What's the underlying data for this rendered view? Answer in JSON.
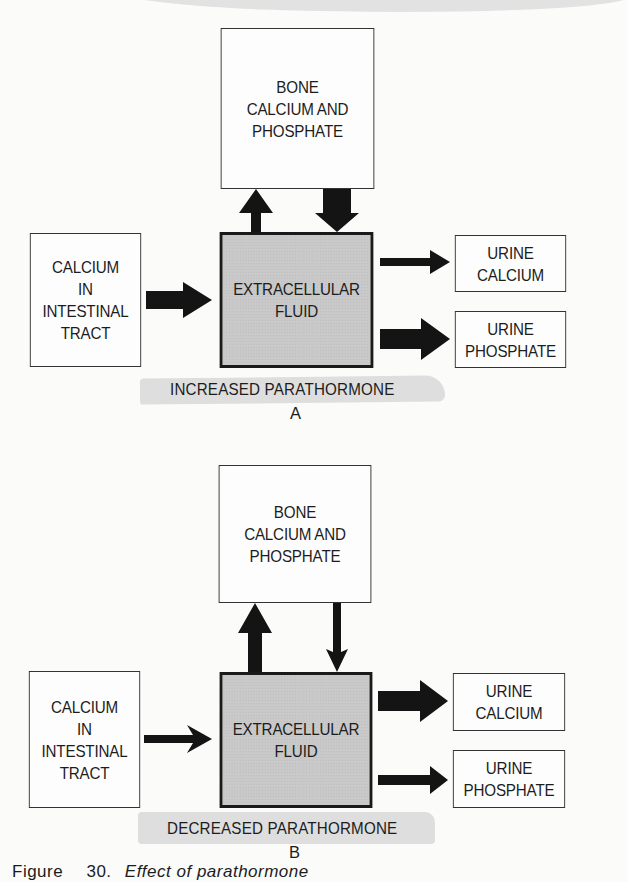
{
  "panels": [
    {
      "id": "A",
      "condition_label": "INCREASED PARATHORMONE",
      "panel_letter": "A",
      "boxes": {
        "bone": [
          "BONE",
          "CALCIUM AND",
          "PHOSPHATE"
        ],
        "intestine": [
          "CALCIUM",
          "IN",
          "INTESTINAL",
          "TRACT"
        ],
        "ecf": [
          "EXTRACELLULAR",
          "FLUID"
        ],
        "urine_calcium": [
          "URINE",
          "CALCIUM"
        ],
        "urine_phosphate": [
          "URINE",
          "PHOSPHATE"
        ]
      },
      "flows": [
        {
          "from": "ecf",
          "to": "bone",
          "magnitude": "medium"
        },
        {
          "from": "bone",
          "to": "ecf",
          "magnitude": "large"
        },
        {
          "from": "intestine",
          "to": "ecf",
          "magnitude": "large"
        },
        {
          "from": "ecf",
          "to": "urine_calcium",
          "magnitude": "small"
        },
        {
          "from": "ecf",
          "to": "urine_phosphate",
          "magnitude": "large"
        }
      ]
    },
    {
      "id": "B",
      "condition_label": "DECREASED PARATHORMONE",
      "panel_letter": "B",
      "boxes": {
        "bone": [
          "BONE",
          "CALCIUM AND",
          "PHOSPHATE"
        ],
        "intestine": [
          "CALCIUM",
          "IN",
          "INTESTINAL",
          "TRACT"
        ],
        "ecf": [
          "EXTRACELLULAR",
          "FLUID"
        ],
        "urine_calcium": [
          "URINE",
          "CALCIUM"
        ],
        "urine_phosphate": [
          "URINE",
          "PHOSPHATE"
        ]
      },
      "flows": [
        {
          "from": "ecf",
          "to": "bone",
          "magnitude": "medium"
        },
        {
          "from": "bone",
          "to": "ecf",
          "magnitude": "thin"
        },
        {
          "from": "intestine",
          "to": "ecf",
          "magnitude": "small"
        },
        {
          "from": "ecf",
          "to": "urine_calcium",
          "magnitude": "large"
        },
        {
          "from": "ecf",
          "to": "urine_phosphate",
          "magnitude": "small"
        }
      ]
    }
  ],
  "caption": {
    "prefix": "Figure",
    "number": "30.",
    "text": "Effect of parathormone"
  },
  "colors": {
    "ecf_fill": "#c9c9c9",
    "arrow": "#141414",
    "stripe": "#dedede"
  }
}
